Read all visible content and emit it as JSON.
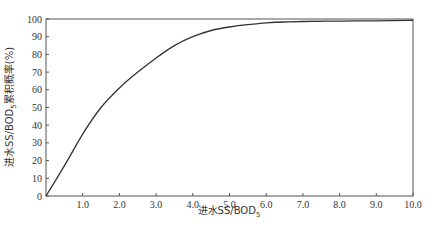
{
  "chart_data": {
    "type": "line",
    "title": "",
    "xlabel": "进水SS/BOD₅",
    "ylabel": "进水SS/BOD₅累积概率(%)",
    "xlim": [
      0,
      10
    ],
    "ylim": [
      0,
      100
    ],
    "grid": false,
    "legend": null,
    "x_ticks": [
      "1.0",
      "2.0",
      "3.0",
      "4.0",
      "5.0",
      "6.0",
      "7.0",
      "8.0",
      "9.0",
      "10.0"
    ],
    "y_ticks": [
      "0",
      "10",
      "20",
      "30",
      "40",
      "50",
      "60",
      "70",
      "80",
      "90",
      "100"
    ],
    "series": [
      {
        "name": "cumulative probability",
        "x": [
          0,
          0.5,
          1.0,
          1.5,
          2.0,
          2.5,
          3.0,
          3.5,
          4.0,
          4.5,
          5.0,
          5.5,
          6.0,
          6.5,
          7.0,
          8.0,
          9.0,
          10.0
        ],
        "y": [
          0,
          17,
          35,
          50,
          61,
          70,
          78,
          85,
          90,
          93.5,
          95.5,
          96.8,
          97.8,
          98.3,
          98.6,
          98.8,
          99.0,
          99.2
        ]
      }
    ]
  },
  "axes": {
    "x_title": "进水SS/BOD",
    "x_title_sub": "5",
    "y_title_prefix": "进水SS/BOD",
    "y_title_sub": "5",
    "y_title_suffix": "累积概率(%)"
  }
}
